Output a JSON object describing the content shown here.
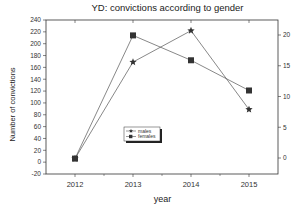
{
  "chart_data": {
    "type": "line",
    "title": "YD: convictions according to gender",
    "xlabel": "year",
    "ylabel": "Number of convictions",
    "categories": [
      "2012",
      "2013",
      "2014",
      "2015"
    ],
    "series": [
      {
        "name": "males",
        "marker": "star",
        "values": [
          6,
          169,
          222,
          89
        ]
      },
      {
        "name": "females",
        "marker": "square",
        "values": [
          6,
          214,
          172,
          121
        ]
      }
    ],
    "ylim": [
      -20,
      240
    ],
    "yticks": [
      -20,
      0,
      20,
      40,
      60,
      80,
      100,
      120,
      140,
      160,
      180,
      200,
      220,
      240
    ],
    "y2ticks": [
      0,
      5,
      10,
      15,
      20
    ],
    "grid": false,
    "legend_position": "inside-center-left"
  }
}
